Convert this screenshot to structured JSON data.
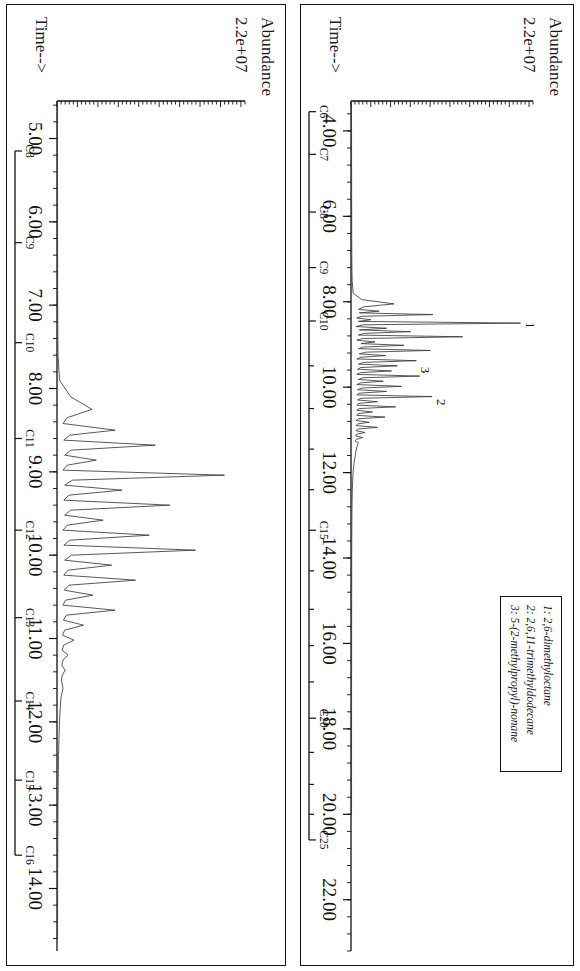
{
  "figure": {
    "panels": [
      {
        "id": "top",
        "yaxis_label": "Abundance",
        "yaxis_value": "2.2e+07",
        "xaxis_label": "Time-->",
        "xticks": [
          "4.00",
          "6.00",
          "8.00",
          "10.00",
          "12.00",
          "14.00",
          "16.00",
          "18.00",
          "20.00",
          "22.00"
        ],
        "carbon_ruler": [
          "C6",
          "C7",
          "C8",
          "C9",
          "C10",
          "C15",
          "C20",
          "C25"
        ],
        "peak_annotations": [
          "1",
          "2",
          "3"
        ]
      },
      {
        "id": "bottom",
        "yaxis_label": "Abundance",
        "yaxis_value": "2.2e+07",
        "xaxis_label": "Time-->",
        "xticks": [
          "5.00",
          "6.00",
          "7.00",
          "8.00",
          "9.00",
          "10.00",
          "11.00",
          "12.00",
          "13.00",
          "14.00"
        ],
        "carbon_ruler": [
          "C8",
          "C9",
          "C10",
          "C11",
          "C12",
          "C13",
          "C14",
          "C15",
          "C16"
        ],
        "peak_annotations": []
      }
    ],
    "legend": {
      "entries": [
        "1: 2,6-dimethyloctane",
        "2: 2,6,11-trimethyldodecane",
        "3: 5-(2-methylpropyl)-nonane"
      ]
    },
    "colors": {
      "trace": "#3a3a3a",
      "axis": "#111111",
      "background": "#ffffff"
    }
  },
  "chart_data": {
    "type": "line",
    "title": "",
    "subtitle": "",
    "panels": [
      {
        "name": "top",
        "title": "",
        "xlabel": "Time-->",
        "ylabel": "Abundance",
        "xlim": [
          3.3,
          23.2
        ],
        "ylim": [
          0,
          22000000.0
        ],
        "ytop_label": "2.2e+07",
        "xticks": [
          4,
          6,
          8,
          10,
          12,
          14,
          16,
          18,
          20,
          22
        ],
        "xticklabels": [
          "4.00",
          "6.00",
          "8.00",
          "10.00",
          "12.00",
          "14.00",
          "16.00",
          "18.00",
          "20.00",
          "22.00"
        ],
        "xminor_interval": 0.4,
        "grid": false,
        "legend_position": "upper-right",
        "secondary_axis": {
          "label": "carbon number",
          "ticks": [
            3.55,
            4.55,
            5.9,
            7.2,
            8.45,
            13.35,
            17.75,
            20.6
          ],
          "ticklabels": [
            "C6",
            "C7",
            "C8",
            "C9",
            "C10",
            "C15",
            "C20",
            "C25"
          ],
          "minor_ticks": [
            9.5,
            10.5,
            11.45,
            12.4,
            14.3,
            15.2,
            16.05,
            16.9,
            18.55,
            19.3,
            20.0
          ]
        },
        "annotations": [
          {
            "text": "1",
            "x": 8.55,
            "y": 20500000
          },
          {
            "text": "2",
            "x": 10.35,
            "y": 9800000
          },
          {
            "text": "3",
            "x": 9.6,
            "y": 7900000
          }
        ],
        "series": [
          {
            "name": "TIC jet fuel (full range)",
            "x": [
              3.3,
              3.6,
              3.9,
              4.2,
              4.5,
              4.8,
              5.1,
              5.4,
              5.7,
              6.0,
              6.3,
              6.6,
              6.9,
              7.2,
              7.5,
              7.8,
              7.95,
              8.05,
              8.12,
              8.18,
              8.22,
              8.26,
              8.3,
              8.34,
              8.38,
              8.42,
              8.46,
              8.5,
              8.54,
              8.58,
              8.62,
              8.66,
              8.7,
              8.74,
              8.78,
              8.82,
              8.86,
              8.9,
              8.94,
              8.98,
              9.02,
              9.06,
              9.1,
              9.14,
              9.18,
              9.22,
              9.26,
              9.3,
              9.34,
              9.38,
              9.42,
              9.46,
              9.5,
              9.54,
              9.58,
              9.62,
              9.66,
              9.7,
              9.74,
              9.78,
              9.82,
              9.86,
              9.9,
              9.94,
              9.98,
              10.02,
              10.06,
              10.1,
              10.14,
              10.18,
              10.22,
              10.26,
              10.3,
              10.34,
              10.38,
              10.42,
              10.46,
              10.5,
              10.54,
              10.58,
              10.62,
              10.66,
              10.7,
              10.74,
              10.78,
              10.82,
              10.86,
              10.9,
              10.94,
              10.98,
              11.02,
              11.06,
              11.1,
              11.14,
              11.18,
              11.22,
              11.26,
              11.3,
              11.4,
              11.5,
              11.6,
              11.7,
              11.8,
              11.9,
              12.0,
              12.2,
              12.4,
              12.7,
              13.0,
              13.5,
              14.0,
              15.0,
              16.0,
              17.0,
              18.0,
              19.0,
              20.0,
              21.0,
              22.0,
              23.0
            ],
            "y": [
              60000,
              60000,
              65000,
              65000,
              70000,
              70000,
              75000,
              75000,
              80000,
              85000,
              85000,
              90000,
              95000,
              110000,
              140000,
              260000,
              1300000,
              5200000,
              1500000,
              900000,
              3400000,
              1000000,
              9900000,
              1400000,
              700000,
              2400000,
              900000,
              20500000,
              1500000,
              600000,
              4300000,
              1000000,
              7200000,
              1600000,
              900000,
              13500000,
              1400000,
              700000,
              2900000,
              1200000,
              6400000,
              1500000,
              900000,
              9600000,
              1800000,
              1000000,
              4200000,
              1200000,
              700000,
              7900000,
              1500000,
              900000,
              5600000,
              1200000,
              800000,
              4900000,
              1100000,
              700000,
              8300000,
              1400000,
              900000,
              3900000,
              1100000,
              700000,
              6100000,
              1300000,
              800000,
              4300000,
              1000000,
              700000,
              9800000,
              1200000,
              800000,
              3200000,
              900000,
              700000,
              5400000,
              1000000,
              700000,
              2600000,
              850000,
              700000,
              4100000,
              900000,
              650000,
              2200000,
              800000,
              600000,
              3200000,
              800000,
              600000,
              1700000,
              700000,
              550000,
              1400000,
              650000,
              500000,
              900000,
              700000,
              600000,
              520000,
              420000,
              360000,
              300000,
              250000,
              200000,
              160000,
              130000,
              110000,
              95000,
              85000,
              80000,
              75000,
              70000,
              68000,
              66000,
              65000
            ]
          }
        ]
      },
      {
        "name": "bottom",
        "title": "",
        "xlabel": "Time-->",
        "ylabel": "Abundance",
        "xlim": [
          4.55,
          14.75
        ],
        "ylim": [
          0,
          22000000.0
        ],
        "ytop_label": "2.2e+07",
        "xticks": [
          5,
          6,
          7,
          8,
          9,
          10,
          11,
          12,
          13,
          14
        ],
        "xticklabels": [
          "5.00",
          "6.00",
          "7.00",
          "8.00",
          "9.00",
          "10.00",
          "11.00",
          "12.00",
          "13.00",
          "14.00"
        ],
        "xminor_interval": 0.2,
        "grid": false,
        "legend_position": "none",
        "secondary_axis": {
          "label": "carbon number",
          "ticks": [
            5.15,
            6.25,
            7.45,
            8.6,
            9.7,
            10.75,
            11.75,
            12.7,
            13.6
          ],
          "ticklabels": [
            "C8",
            "C9",
            "C10",
            "C11",
            "C12",
            "C13",
            "C14",
            "C15",
            "C16"
          ],
          "minor_ticks": []
        },
        "annotations": [],
        "series": [
          {
            "name": "TIC diesel (narrow range)",
            "x": [
              4.55,
              4.9,
              5.2,
              5.5,
              5.8,
              6.1,
              6.4,
              6.7,
              7.0,
              7.3,
              7.6,
              7.9,
              8.1,
              8.25,
              8.35,
              8.42,
              8.5,
              8.56,
              8.62,
              8.68,
              8.74,
              8.8,
              8.86,
              8.92,
              8.98,
              9.04,
              9.1,
              9.16,
              9.22,
              9.28,
              9.34,
              9.4,
              9.46,
              9.52,
              9.58,
              9.64,
              9.7,
              9.76,
              9.82,
              9.88,
              9.94,
              10.0,
              10.06,
              10.12,
              10.18,
              10.24,
              10.3,
              10.36,
              10.42,
              10.48,
              10.54,
              10.6,
              10.66,
              10.72,
              10.78,
              10.84,
              10.9,
              10.96,
              11.02,
              11.08,
              11.14,
              11.2,
              11.26,
              11.32,
              11.38,
              11.44,
              11.5,
              11.6,
              11.7,
              11.8,
              11.9,
              12.0,
              12.2,
              12.4,
              12.7,
              13.0,
              13.4,
              13.8,
              14.2,
              14.6
            ],
            "y": [
              55000,
              55000,
              60000,
              60000,
              65000,
              65000,
              70000,
              75000,
              80000,
              90000,
              120000,
              300000,
              1600000,
              4100000,
              1200000,
              700000,
              6800000,
              1500000,
              800000,
              11500000,
              1600000,
              900000,
              4600000,
              1200000,
              700000,
              19600000,
              1800000,
              900000,
              7600000,
              1400000,
              800000,
              13200000,
              1600000,
              900000,
              5400000,
              1200000,
              700000,
              10800000,
              1500000,
              800000,
              16200000,
              1700000,
              900000,
              6400000,
              1300000,
              800000,
              9200000,
              1400000,
              850000,
              4200000,
              1000000,
              700000,
              6800000,
              1100000,
              750000,
              3100000,
              900000,
              650000,
              2000000,
              780000,
              600000,
              1300000,
              700000,
              560000,
              950000,
              620000,
              520000,
              700000,
              480000,
              400000,
              340000,
              290000,
              230000,
              180000,
              140000,
              115000,
              95000,
              80000,
              70000,
              62000
            ]
          }
        ]
      }
    ]
  }
}
